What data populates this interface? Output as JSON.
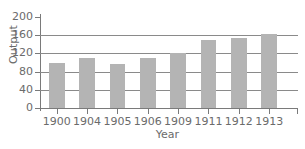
{
  "chart_data": {
    "type": "bar",
    "title": "",
    "xlabel": "Year",
    "ylabel": "Output",
    "categories": [
      "1900",
      "1904",
      "1905",
      "1906",
      "1909",
      "1911",
      "1912",
      "1913"
    ],
    "values": [
      100,
      110,
      97,
      111,
      120,
      150,
      153,
      163
    ],
    "series": [
      {
        "name": "Output",
        "values": [
          100,
          110,
          97,
          111,
          120,
          150,
          153,
          163
        ]
      }
    ],
    "ylim": [
      0,
      200
    ],
    "yticks": [
      0,
      40,
      80,
      120,
      160,
      200
    ],
    "ytick_labels": [
      "0",
      "40",
      "80",
      "120",
      "160",
      "200"
    ],
    "grid": true,
    "grid_axis": "y",
    "gridlines_at": [
      40,
      80,
      120,
      160
    ],
    "legend": null,
    "legend_position": "none",
    "bar_color": "#b4b4b4",
    "axis_color": "#7a7a7a",
    "grid_color": "#8a8a8a",
    "text_color": "#6b6b6b",
    "background_color": "#ffffff"
  }
}
